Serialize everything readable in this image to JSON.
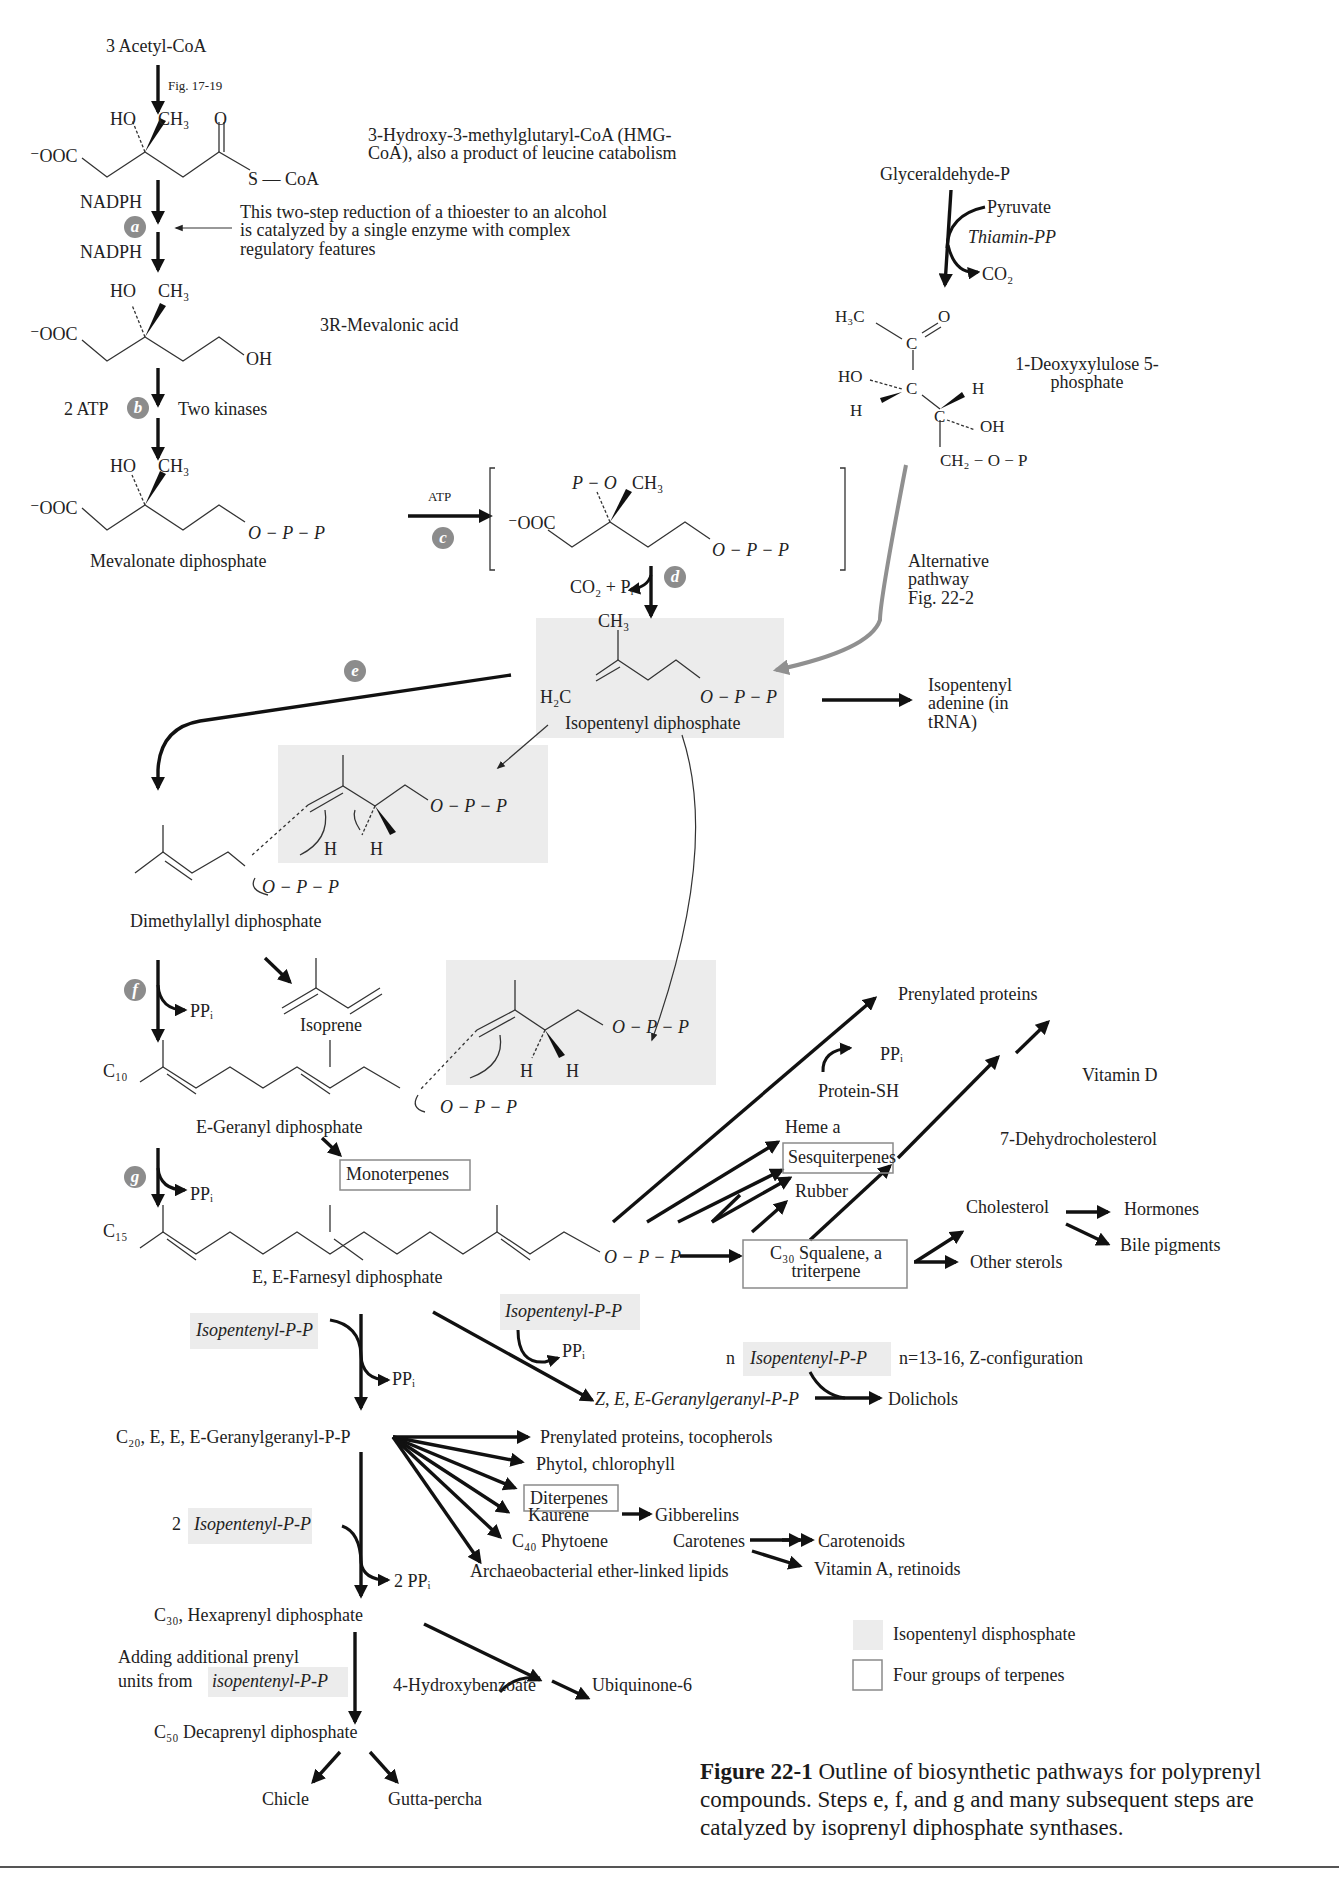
{
  "figure": {
    "top_cut_text": "",
    "caption_bold": "Figure 22-1",
    "caption_text": "Outline of biosynthetic pathways for polyprenyl compounds.  Steps e, f, and g and many subsequent steps are catalyzed by isoprenyl diphosphate synthases."
  },
  "mevalonate_pathway": {
    "start": "3  Acetyl-CoA",
    "fig_ref": "Fig. 17-19",
    "hmg_ho": "HO",
    "hmg_ch3": "CH₃",
    "hmg_o": "O",
    "hmg_ooc": "⁻OOC",
    "hmg_scoa": "S — CoA",
    "hmg_label": "3-Hydroxy-3-methylglutaryl-CoA (HMG-CoA), also a product of leucine catabolism",
    "nadph1": "NADPH",
    "nadph2": "NADPH",
    "step_a": "a",
    "step_a_note": "This two-step reduction of a thioester to an alcohol is catalyzed by a single enzyme with complex regulatory features",
    "mev_ho": "HO",
    "mev_ch3": "CH₃",
    "mev_ooc": "⁻OOC",
    "mev_oh": "OH",
    "mev_label": "3R-Mevalonic acid",
    "atp2": "2  ATP",
    "step_b": "b",
    "kinases": "Two kinases",
    "mdp_ho": "HO",
    "mdp_ch3": "CH₃",
    "mdp_ooc": "⁻OOC",
    "mdp_opp": "O − P − P",
    "mdp_label": "Mevalonate diphosphate",
    "atp_c": "ATP",
    "step_c": "c",
    "int_po": "P − O",
    "int_ch3": "CH₃",
    "int_ooc": "⁻OOC",
    "int_opp": "O − P − P",
    "co2_pi": "CO₂ + Pᵢ",
    "step_d": "d"
  },
  "alternative_pathway": {
    "glyceraldehyde": "Glyceraldehyde-P",
    "pyruvate": "Pyruvate",
    "thiamin": "Thiamin-PP",
    "co2": "CO₂",
    "h3c": "H₃C",
    "o": "O",
    "c1": "C",
    "ho": "HO",
    "c2": "C",
    "h1": "H",
    "h2": "H",
    "c3": "C",
    "oh": "OH",
    "ch2op": "CH₂ − O − P",
    "dxp_label": "1-Deoxyxylulose 5-phosphate",
    "alt_label": "Alternative pathway Fig. 22-2"
  },
  "ipp": {
    "ch3": "CH₃",
    "h2c": "H₂C",
    "opp": "O − P − P",
    "label": "Isopentenyl diphosphate",
    "isopentenyl_adenine": "Isopentenyl adenine (in tRNA)",
    "step_e": "e"
  },
  "condensation": {
    "ipp1_opp": "O − P − P",
    "ipp1_h1": "H",
    "ipp1_h2": "H",
    "dmapp_opp": "O − P − P",
    "dmapp_label": "Dimethylallyl diphosphate",
    "step_f": "f",
    "ppi_f": "PPᵢ",
    "isoprene": "Isoprene",
    "ipp2_opp": "O − P − P",
    "ipp2_h1": "H",
    "ipp2_h2": "H",
    "c10": "C₁₀",
    "gpp_opp": "O − P − P",
    "gpp_label": "E-Geranyl diphosphate",
    "monoterpenes": "Monoterpenes",
    "step_g": "g",
    "ppi_g": "PPᵢ",
    "c15": "C₁₅",
    "fpp_opp": "O − P − P",
    "fpp_label": "E, E-Farnesyl diphosphate"
  },
  "fpp_products": {
    "prenylated_proteins": "Prenylated proteins",
    "ppi": "PPᵢ",
    "protein_sh": "Protein-SH",
    "heme_a": "Heme a",
    "sesquiterpenes": "Sesquiterpenes",
    "rubber": "Rubber",
    "squalene": "C₃₀ Squalene, a triterpene",
    "vitamin_d": "Vitamin D",
    "dehydrocholesterol": "7-Dehydrocholesterol",
    "cholesterol": "Cholesterol",
    "hormones": "Hormones",
    "bile_pigments": "Bile pigments",
    "other_sterols": "Other sterols"
  },
  "chain_extension": {
    "ipp_a": "Isopentenyl-P-P",
    "ppi_a": "PPᵢ",
    "ipp_b": "Isopentenyl-P-P",
    "ppi_b": "PPᵢ",
    "zee_ggpp": "Z, E, E-Geranylgeranyl-P-P",
    "n": "n",
    "ipp_n": "Isopentenyl-P-P",
    "n_note": "n=13-16, Z-configuration",
    "dolichols": "Dolichols",
    "ggpp": "C₂₀, E, E, E-Geranylgeranyl-P-P",
    "two": "2",
    "ipp_2": "Isopentenyl-P-P",
    "ppi_2": "2 PPᵢ",
    "hexaprenyl": "C₃₀, Hexaprenyl diphosphate",
    "adding_note_1": "Adding additional prenyl",
    "adding_note_2": "units from",
    "adding_note_ipp": "isopentenyl-P-P",
    "hydroxybenzoate": "4-Hydroxybenzoate",
    "ubiquinone": "Ubiquinone-6",
    "decaprenyl": "C₅₀ Decaprenyl diphosphate",
    "chicle": "Chicle",
    "gutta": "Gutta-percha"
  },
  "ggpp_products": {
    "p1": "Prenylated proteins, tocopherols",
    "p2": "Phytol, chlorophyll",
    "p3": "Diterpenes",
    "p4": "Kaurene",
    "p4b": "Gibberelins",
    "p5": "C₄₀ Phytoene",
    "p5b": "Carotenes",
    "p5c": "Carotenoids",
    "p5d": "Vitamin A, retinoids",
    "p6": "Archaeobacterial ether-linked lipids"
  },
  "legend": {
    "shaded": "Isopentenyl disphosphate",
    "boxed": "Four groups of terpenes",
    "shade_color": "#ececec",
    "box_color": "#8a8a8a"
  }
}
